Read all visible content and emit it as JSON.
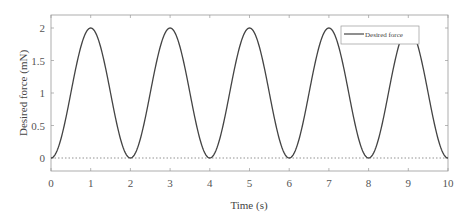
{
  "chart_data": {
    "type": "line",
    "title": "",
    "xlabel": "Time (s)",
    "ylabel": "Desired force (mN)",
    "xlim": [
      0,
      10
    ],
    "ylim": [
      -0.2,
      2.2
    ],
    "xticks": [
      0,
      1,
      2,
      3,
      4,
      5,
      6,
      7,
      8,
      9,
      10
    ],
    "yticks": [
      0,
      0.5,
      1,
      1.5,
      2
    ],
    "ytick_labels": [
      "0",
      "0.5",
      "1",
      "1.5",
      "2"
    ],
    "grid": false,
    "legend_position": "upper right",
    "series": [
      {
        "name": "Desired force",
        "style": "solid",
        "color": "#444444",
        "formula": "1 - cos(pi * t)",
        "x": [
          0,
          0.5,
          1,
          1.5,
          2,
          2.5,
          3,
          3.5,
          4,
          4.5,
          5,
          5.5,
          6,
          6.5,
          7,
          7.5,
          8,
          8.5,
          9,
          9.5,
          10
        ],
        "values": [
          0,
          1,
          2,
          1,
          0,
          1,
          2,
          1,
          0,
          1,
          2,
          1,
          0,
          1,
          2,
          1,
          0,
          1,
          2,
          1,
          0
        ]
      }
    ],
    "reference_line": {
      "y": 0,
      "style": "dotted"
    }
  },
  "legend": {
    "entries": [
      "Desired force"
    ]
  },
  "axes": {
    "xlabel": "Time (s)",
    "ylabel": "Desired force (mN)",
    "xtick_labels": [
      "0",
      "1",
      "2",
      "3",
      "4",
      "5",
      "6",
      "7",
      "8",
      "9",
      "10"
    ],
    "ytick_labels": [
      "0",
      "0.5",
      "1",
      "1.5",
      "2"
    ]
  }
}
